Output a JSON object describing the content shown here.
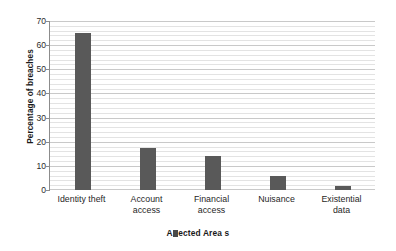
{
  "chart_data": {
    "type": "bar",
    "title": "",
    "subtitle": "",
    "xlabel": "Affected Areas",
    "xlabel_rendered": "Affected Area s",
    "ylabel": "Percentage of breaches",
    "categories": [
      "Identity theft",
      "Account access",
      "Financial access",
      "Nuisance",
      "Existential data"
    ],
    "values": [
      65,
      17.6,
      14.2,
      5.9,
      1.5
    ],
    "ylim": [
      0,
      70
    ],
    "ytick_labels": [
      "0",
      "10",
      "20",
      "30",
      "40",
      "50",
      "60",
      "70"
    ],
    "ytick_values": [
      0,
      10,
      20,
      30,
      40,
      50,
      60,
      70
    ],
    "ymajor_step": 10,
    "yminor_step": 2,
    "grid": "horizontal-major-and-minor",
    "legend": "none",
    "legend_position": "none",
    "bar_color": "#595959",
    "gridline_major_color": "#c9c9c9",
    "gridline_minor_color": "#e3e3e3",
    "axis_color": "#8c8c8c",
    "background_color": "#ffffff",
    "annotations": []
  },
  "axis": {
    "y_title": "Percentage of breaches",
    "x_title_parts": {
      "before": "A",
      "after": "ected Area s"
    }
  },
  "categories_display": [
    "Identity theft",
    "Account\naccess",
    "Financial\naccess",
    "Nuisance",
    "Existential\ndata"
  ]
}
